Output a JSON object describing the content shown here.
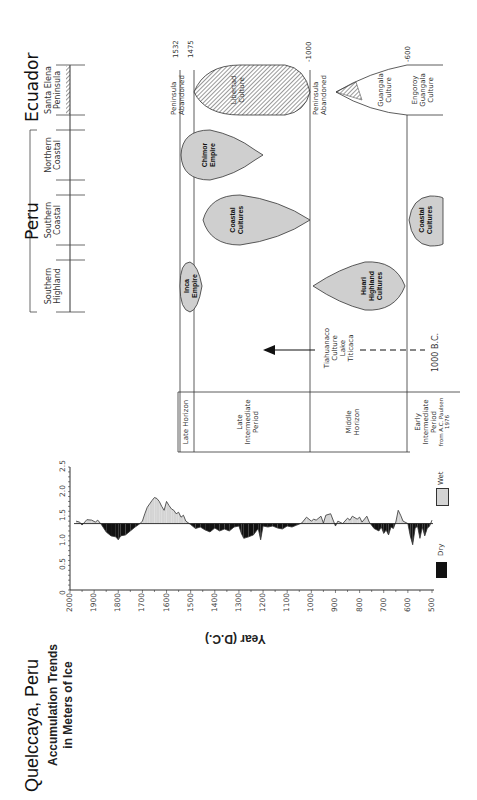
{
  "regions": {
    "peru_label": "Peru",
    "ecuador_label": "Ecuador",
    "columns": [
      {
        "line1": "Santa Elena",
        "line2": "Peninsula",
        "country": "Ecuador"
      },
      {
        "line1": "Northern",
        "line2": "Coastal",
        "country": "Peru"
      },
      {
        "line1": "Southern",
        "line2": "Coastal",
        "country": "Peru"
      },
      {
        "line1": "Southern",
        "line2": "Highland",
        "country": "Peru"
      }
    ]
  },
  "timeline": {
    "markers": [
      {
        "label": "1532",
        "note1": "Peninsula",
        "note2": "Abandoned"
      },
      {
        "label": "1475"
      },
      {
        "label": "-1000",
        "note1": "Peninsula",
        "note2": "Abandoned"
      },
      {
        "label": "-600"
      }
    ],
    "cultures": [
      {
        "name1": "Libertad",
        "name2": "Culture",
        "region": "Santa Elena Peninsula"
      },
      {
        "name1": "Guangala",
        "name2": "Culture",
        "region": "Santa Elena Peninsula"
      },
      {
        "name1": "Engoroy",
        "name2": "Guangala",
        "name3": "Culture",
        "region": "Santa Elena Peninsula"
      },
      {
        "name1": "Chimor",
        "name2": "Empire",
        "region": "Northern Coastal"
      },
      {
        "name1": "Coastal",
        "name2": "Cultures",
        "region": "Southern Coastal"
      },
      {
        "name1": "Coastal",
        "name2": "Cultures",
        "region": "Southern Coastal",
        "period": "early"
      },
      {
        "name1": "Inca",
        "name2": "Empire",
        "region": "Southern Highland"
      },
      {
        "name1": "Huari",
        "name2": "Highland",
        "name3": "Cultures",
        "region": "Southern Highland"
      }
    ],
    "tiahuanaco": {
      "line1": "Tiahuanaco",
      "line2": "Culture",
      "line3": "Lake",
      "line4": "Titicaca",
      "start": "1000 B.C."
    },
    "periods": [
      {
        "line1": "Late Horizon"
      },
      {
        "line1": "Late",
        "line2": "Intermediate",
        "line3": "Period"
      },
      {
        "line1": "Middle",
        "line2": "Horizon"
      },
      {
        "line1": "Early",
        "line2": "Intermediate",
        "line3": "Period"
      }
    ],
    "source": "from A.C. Paulsen",
    "source_year": "1976"
  },
  "chart": {
    "title": "Quelccaya, Peru",
    "subtitle1": "Accumulation Trends",
    "subtitle2": "in Meters of Ice",
    "xlabel": "Year (D.C.)",
    "legend_wet": "Wet",
    "legend_dry": "Dry",
    "colors": {
      "wet": "#d4d4d4",
      "dry": "#111111",
      "line": "#333333"
    }
  },
  "chart_data": {
    "type": "area",
    "xlabel": "Year (D.C.)",
    "ylabel": "Meters of ice",
    "x_ticks": [
      2000,
      1900,
      1800,
      1700,
      1600,
      1500,
      1400,
      1300,
      1200,
      1100,
      1000,
      900,
      800,
      700,
      600,
      500
    ],
    "y_ticks": [
      0,
      0.5,
      1.0,
      1.5,
      2.0,
      2.5
    ],
    "xlim": [
      2000,
      500
    ],
    "ylim": [
      0,
      2.5
    ],
    "baseline": 1.35,
    "legend": [
      "Dry",
      "Wet"
    ],
    "x": [
      1975,
      1960,
      1950,
      1930,
      1910,
      1895,
      1885,
      1870,
      1850,
      1830,
      1810,
      1800,
      1790,
      1770,
      1750,
      1730,
      1710,
      1700,
      1690,
      1680,
      1670,
      1660,
      1650,
      1640,
      1630,
      1620,
      1610,
      1600,
      1590,
      1580,
      1570,
      1560,
      1550,
      1540,
      1530,
      1520,
      1500,
      1480,
      1460,
      1440,
      1420,
      1400,
      1380,
      1360,
      1340,
      1320,
      1300,
      1290,
      1280,
      1260,
      1240,
      1220,
      1210,
      1200,
      1180,
      1160,
      1140,
      1120,
      1100,
      1080,
      1060,
      1040,
      1020,
      1000,
      990,
      980,
      960,
      950,
      940,
      920,
      900,
      890,
      870,
      850,
      840,
      830,
      810,
      800,
      790,
      770,
      760,
      740,
      720,
      710,
      700,
      690,
      680,
      670,
      660,
      650,
      640,
      630,
      620,
      600,
      590,
      580,
      570,
      560,
      550,
      540,
      530,
      520,
      510,
      500
    ],
    "values": [
      1.4,
      1.38,
      1.32,
      1.43,
      1.42,
      1.38,
      1.42,
      1.33,
      1.18,
      1.1,
      1.08,
      1.02,
      1.1,
      1.12,
      1.2,
      1.28,
      1.35,
      1.4,
      1.55,
      1.68,
      1.75,
      1.82,
      1.88,
      1.86,
      1.8,
      1.7,
      1.62,
      1.8,
      1.72,
      1.65,
      1.62,
      1.55,
      1.58,
      1.48,
      1.52,
      1.4,
      1.33,
      1.25,
      1.28,
      1.22,
      1.18,
      1.26,
      1.2,
      1.24,
      1.2,
      1.28,
      1.3,
      1.15,
      1.05,
      1.08,
      1.12,
      1.25,
      1.02,
      1.3,
      1.28,
      1.3,
      1.26,
      1.24,
      1.3,
      1.28,
      1.32,
      1.36,
      1.48,
      1.4,
      1.44,
      1.42,
      1.5,
      1.36,
      1.52,
      1.55,
      1.3,
      1.4,
      1.35,
      1.46,
      1.42,
      1.5,
      1.44,
      1.48,
      1.38,
      1.5,
      1.38,
      1.25,
      1.2,
      1.28,
      1.15,
      1.22,
      1.12,
      1.28,
      1.25,
      1.38,
      1.62,
      1.52,
      1.4,
      1.35,
      1.1,
      0.92,
      1.25,
      1.3,
      1.05,
      1.28,
      1.1,
      1.25,
      1.3,
      1.42
    ]
  }
}
